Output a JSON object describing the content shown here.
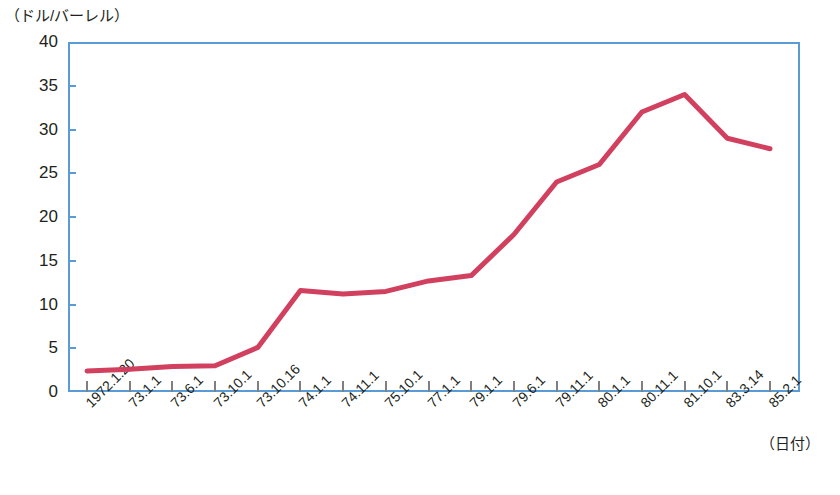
{
  "chart_data": {
    "type": "line",
    "title": "",
    "ylabel": "（ドル/バーレル）",
    "xlabel": "（日付）",
    "ylim": [
      0,
      40
    ],
    "y_ticks": [
      40,
      35,
      30,
      25,
      20,
      15,
      10,
      5,
      0
    ],
    "grid": false,
    "legend": "none",
    "line_color": "#d2405f",
    "axis_color": "#5b9bd5",
    "categories": [
      "1972.1.20",
      "73.1.1",
      "73.6.1",
      "73.10.1",
      "73.10.16",
      "74.1.1",
      "74.11.1",
      "75.10.1",
      "77.1.1",
      "79.1.1",
      "79.6.1",
      "79.11.1",
      "80.1.1",
      "80.11.1",
      "81.10.1",
      "83.3.14",
      "85.2.1"
    ],
    "values": [
      2.4,
      2.6,
      2.9,
      3.0,
      5.1,
      11.6,
      11.2,
      11.5,
      12.7,
      13.3,
      18.0,
      24.0,
      26.0,
      32.0,
      34.0,
      29.0,
      27.8
    ]
  },
  "axes": {
    "y_unit_caption": "（ドル/バーレル）",
    "x_caption": "（日付）"
  },
  "footer": {
    "source_note": ""
  }
}
